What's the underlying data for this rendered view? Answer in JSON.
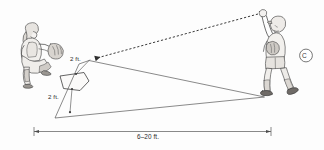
{
  "figure": {
    "type": "instructional-line-drawing",
    "background_color": "#fdfdfd",
    "line_color": "#3a3a3a"
  },
  "labels": {
    "upper_height": "2 ft.",
    "lower_height": "2 ft.",
    "distance_span": "6–20 ft.",
    "reference_mark": "C"
  },
  "annotations": {
    "upper_height_note": "2 ft. above home plate — top of strike zone",
    "lower_height_note": "2 ft. below / in front of home plate — bottom of strike zone",
    "distance_note": "6–20 ft. distance between thrower and plate",
    "reference_note": "Circled letter C reference callout"
  },
  "elements": {
    "catcher": "crouching-catcher-figure",
    "thrower": "standing-thrower-figure",
    "plate": "home-plate-pentagon",
    "trajectory": "dashed-ball-path-arrow",
    "zone_lines": "solid-strike-zone-lines",
    "dimension_line": "horizontal-dimension-line"
  }
}
